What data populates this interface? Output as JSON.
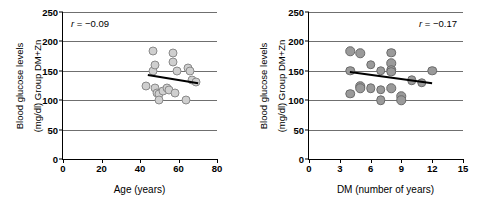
{
  "figure": {
    "panels": [
      {
        "id": "panel-age",
        "annotation": "r = −0.09",
        "annotation_r": "r",
        "annotation_value": "= −0.09",
        "xlabel": "Age (years)",
        "ylabel_line1": "Blood glucose levels",
        "ylabel_line2": "(mg/dl) Group DM+Zn",
        "xticks": [
          "0",
          "20",
          "40",
          "60",
          "80"
        ],
        "yticks": [
          "0",
          "50",
          "100",
          "150",
          "200",
          "250"
        ]
      },
      {
        "id": "panel-dm",
        "annotation": "r = −0.17",
        "annotation_r": "r",
        "annotation_value": "= −0.17",
        "xlabel": "DM (number of years)",
        "ylabel_line1": "Blood glucose levels",
        "ylabel_line2": "(mg/dl) Group DM+Zn",
        "xticks": [
          "0",
          "3",
          "6",
          "9",
          "12",
          "15"
        ],
        "yticks": [
          "0",
          "50",
          "100",
          "150",
          "200",
          "250"
        ]
      }
    ]
  },
  "chart_data": [
    {
      "type": "scatter",
      "title": "",
      "xlabel": "Age (years)",
      "ylabel": "Blood glucose levels (mg/dl) Group DM+Zn",
      "xlim": [
        0,
        80
      ],
      "ylim": [
        0,
        250
      ],
      "xticks": [
        0,
        20,
        40,
        60,
        80
      ],
      "yticks": [
        0,
        50,
        100,
        150,
        200,
        250
      ],
      "grid": "horizontal",
      "annotation": "r = −0.09",
      "correlation_r": -0.09,
      "marker_color": "#cfcfcf",
      "marker_edge_color": "#8a8a8a",
      "points": [
        {
          "x": 43,
          "y": 124
        },
        {
          "x": 47,
          "y": 183
        },
        {
          "x": 47,
          "y": 150
        },
        {
          "x": 48,
          "y": 160
        },
        {
          "x": 48,
          "y": 120
        },
        {
          "x": 49,
          "y": 112
        },
        {
          "x": 50,
          "y": 110
        },
        {
          "x": 50,
          "y": 100
        },
        {
          "x": 52,
          "y": 115
        },
        {
          "x": 54,
          "y": 120
        },
        {
          "x": 55,
          "y": 118
        },
        {
          "x": 57,
          "y": 180
        },
        {
          "x": 57,
          "y": 165
        },
        {
          "x": 58,
          "y": 112
        },
        {
          "x": 59,
          "y": 150
        },
        {
          "x": 64,
          "y": 100
        },
        {
          "x": 65,
          "y": 155
        },
        {
          "x": 66,
          "y": 150
        },
        {
          "x": 67,
          "y": 135
        },
        {
          "x": 69,
          "y": 131
        }
      ],
      "trendline": {
        "x0": 44,
        "y0": 145,
        "x1": 70,
        "y1": 131
      }
    },
    {
      "type": "scatter",
      "title": "",
      "xlabel": "DM (number of years)",
      "ylabel": "Blood glucose levels (mg/dl) Group DM+Zn",
      "xlim": [
        0,
        15
      ],
      "ylim": [
        0,
        250
      ],
      "xticks": [
        0,
        3,
        6,
        9,
        12,
        15
      ],
      "yticks": [
        0,
        50,
        100,
        150,
        200,
        250
      ],
      "grid": "horizontal",
      "annotation": "r = −0.17",
      "correlation_r": -0.17,
      "marker_color": "#9a9a9a",
      "marker_edge_color": "#6a6a6a",
      "points": [
        {
          "x": 4.0,
          "y": 183
        },
        {
          "x": 4.0,
          "y": 150
        },
        {
          "x": 4.0,
          "y": 111
        },
        {
          "x": 5.0,
          "y": 180
        },
        {
          "x": 5.0,
          "y": 124
        },
        {
          "x": 5.0,
          "y": 120
        },
        {
          "x": 6.0,
          "y": 160
        },
        {
          "x": 6.0,
          "y": 120
        },
        {
          "x": 7.0,
          "y": 150
        },
        {
          "x": 7.0,
          "y": 118
        },
        {
          "x": 7.0,
          "y": 100
        },
        {
          "x": 8.0,
          "y": 181
        },
        {
          "x": 8.0,
          "y": 163
        },
        {
          "x": 8.0,
          "y": 152
        },
        {
          "x": 8.0,
          "y": 148
        },
        {
          "x": 8.0,
          "y": 120
        },
        {
          "x": 9.0,
          "y": 107
        },
        {
          "x": 9.0,
          "y": 100
        },
        {
          "x": 10.0,
          "y": 134
        },
        {
          "x": 11.0,
          "y": 130
        },
        {
          "x": 12.0,
          "y": 150
        }
      ],
      "trendline": {
        "x0": 4.0,
        "y0": 149,
        "x1": 12.0,
        "y1": 130
      }
    }
  ]
}
